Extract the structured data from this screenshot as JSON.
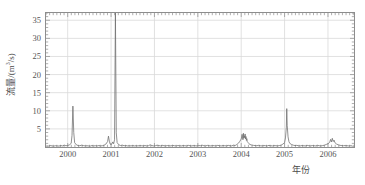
{
  "chart_data": {
    "type": "line",
    "title": "",
    "xlabel": "年份",
    "ylabel_text": "流量/(m",
    "ylabel_sup": "3",
    "ylabel_tail": "/s)",
    "ylabel_full": "流量/(m3/s)",
    "grid": true,
    "legend": "none",
    "xlim": [
      1999.5,
      2006.6
    ],
    "ylim": [
      0,
      37
    ],
    "yticks": [
      5,
      10,
      15,
      20,
      25,
      30,
      35
    ],
    "ytick_labels": [
      "5",
      "10",
      "15",
      "20",
      "25",
      "30",
      "35"
    ],
    "xticks": [
      2000,
      2001,
      2002,
      2003,
      2004,
      2005,
      2006
    ],
    "xtick_labels": [
      "2000",
      "2001",
      "2002",
      "2003",
      "2004",
      "2005",
      "2006"
    ],
    "line_color": "#6b6b6b",
    "grid_color": "#d9d9d9",
    "axis_color": "#8d8d8d",
    "text_color": "#555555",
    "annotations": [
      {
        "x": 2000.12,
        "y": 11.3,
        "label": "2000 peak"
      },
      {
        "x": 2001.1,
        "y": 37.0,
        "label": "2001 peak (clipped off-scale)"
      },
      {
        "x": 2005.05,
        "y": 10.6,
        "label": "2005 peak"
      }
    ],
    "x": [
      1999.52,
      1999.56,
      1999.6,
      1999.64,
      1999.68,
      1999.72,
      1999.76,
      1999.8,
      1999.84,
      1999.88,
      1999.92,
      1999.96,
      2000.0,
      2000.04,
      2000.08,
      2000.1,
      2000.12,
      2000.14,
      2000.16,
      2000.2,
      2000.24,
      2000.28,
      2000.32,
      2000.36,
      2000.4,
      2000.44,
      2000.48,
      2000.52,
      2000.56,
      2000.6,
      2000.64,
      2000.68,
      2000.72,
      2000.76,
      2000.8,
      2000.84,
      2000.88,
      2000.92,
      2000.94,
      2000.96,
      2000.98,
      2001.0,
      2001.02,
      2001.04,
      2001.06,
      2001.08,
      2001.1,
      2001.12,
      2001.14,
      2001.18,
      2001.22,
      2001.26,
      2001.3,
      2001.34,
      2001.38,
      2001.42,
      2001.46,
      2001.5,
      2001.54,
      2001.58,
      2001.62,
      2001.66,
      2001.7,
      2001.74,
      2001.78,
      2001.82,
      2001.86,
      2001.9,
      2001.94,
      2001.98,
      2002.02,
      2002.06,
      2002.1,
      2002.14,
      2002.18,
      2002.22,
      2002.26,
      2002.3,
      2002.34,
      2002.38,
      2002.42,
      2002.46,
      2002.5,
      2002.54,
      2002.58,
      2002.62,
      2002.66,
      2002.7,
      2002.74,
      2002.78,
      2002.82,
      2002.86,
      2002.9,
      2002.94,
      2002.98,
      2003.02,
      2003.06,
      2003.1,
      2003.14,
      2003.18,
      2003.22,
      2003.26,
      2003.3,
      2003.34,
      2003.38,
      2003.42,
      2003.46,
      2003.5,
      2003.54,
      2003.58,
      2003.62,
      2003.66,
      2003.7,
      2003.74,
      2003.78,
      2003.82,
      2003.86,
      2003.9,
      2003.94,
      2003.97,
      2004.0,
      2004.02,
      2004.04,
      2004.05,
      2004.06,
      2004.07,
      2004.08,
      2004.09,
      2004.1,
      2004.11,
      2004.12,
      2004.13,
      2004.14,
      2004.16,
      2004.18,
      2004.2,
      2004.24,
      2004.28,
      2004.32,
      2004.36,
      2004.4,
      2004.44,
      2004.48,
      2004.52,
      2004.56,
      2004.6,
      2004.64,
      2004.68,
      2004.72,
      2004.76,
      2004.8,
      2004.84,
      2004.88,
      2004.92,
      2004.96,
      2005.0,
      2005.02,
      2005.04,
      2005.05,
      2005.06,
      2005.08,
      2005.1,
      2005.12,
      2005.16,
      2005.2,
      2005.24,
      2005.28,
      2005.32,
      2005.36,
      2005.4,
      2005.44,
      2005.48,
      2005.52,
      2005.56,
      2005.6,
      2005.64,
      2005.68,
      2005.72,
      2005.76,
      2005.8,
      2005.84,
      2005.88,
      2005.92,
      2005.96,
      2006.0,
      2006.04,
      2006.06,
      2006.08,
      2006.1,
      2006.12,
      2006.14,
      2006.16,
      2006.2,
      2006.24,
      2006.28,
      2006.32,
      2006.36,
      2006.4,
      2006.44,
      2006.48,
      2006.52,
      2006.56
    ],
    "y": [
      0.3,
      0.25,
      0.4,
      0.3,
      0.25,
      0.35,
      0.3,
      0.25,
      0.4,
      0.3,
      0.5,
      0.35,
      0.4,
      0.6,
      1.0,
      3.2,
      11.3,
      4.0,
      1.2,
      0.6,
      0.4,
      0.35,
      0.5,
      0.4,
      0.3,
      0.35,
      0.3,
      0.25,
      0.4,
      0.3,
      0.35,
      0.3,
      0.4,
      0.3,
      0.35,
      0.5,
      0.8,
      1.5,
      3.0,
      1.6,
      0.8,
      0.6,
      0.9,
      1.4,
      0.9,
      2.0,
      37.0,
      3.9,
      1.2,
      0.6,
      0.4,
      0.5,
      0.35,
      0.4,
      0.3,
      0.35,
      0.3,
      0.4,
      0.3,
      0.35,
      0.3,
      0.4,
      0.35,
      0.3,
      0.4,
      0.3,
      0.35,
      0.6,
      0.4,
      0.3,
      0.35,
      0.5,
      0.4,
      0.3,
      0.45,
      0.35,
      0.3,
      0.4,
      0.35,
      0.3,
      0.45,
      0.35,
      0.3,
      0.4,
      0.35,
      0.3,
      0.4,
      0.35,
      0.3,
      0.45,
      0.35,
      0.3,
      0.4,
      0.35,
      0.3,
      0.4,
      0.35,
      0.5,
      0.35,
      0.3,
      0.45,
      0.35,
      0.3,
      0.4,
      0.35,
      0.3,
      0.45,
      0.35,
      0.3,
      0.4,
      0.35,
      0.3,
      0.45,
      0.35,
      0.3,
      0.5,
      0.4,
      0.7,
      1.1,
      1.6,
      2.2,
      3.5,
      2.0,
      3.8,
      2.4,
      3.1,
      2.6,
      3.6,
      2.2,
      2.9,
      1.8,
      2.3,
      1.5,
      1.2,
      0.9,
      0.7,
      0.55,
      0.45,
      0.4,
      0.35,
      0.45,
      0.35,
      0.3,
      0.4,
      0.35,
      0.3,
      0.45,
      0.35,
      0.3,
      0.4,
      0.35,
      0.3,
      0.4,
      0.5,
      0.8,
      1.2,
      2.5,
      5.5,
      10.6,
      6.0,
      2.8,
      1.5,
      1.0,
      0.7,
      0.5,
      0.4,
      0.45,
      0.35,
      0.3,
      0.4,
      0.35,
      0.3,
      0.45,
      0.35,
      0.3,
      0.4,
      0.35,
      0.3,
      0.45,
      0.35,
      0.3,
      0.4,
      0.5,
      0.7,
      0.9,
      1.3,
      2.1,
      1.4,
      2.4,
      1.5,
      1.9,
      1.2,
      0.8,
      0.6,
      0.45,
      0.4,
      0.35,
      0.4,
      0.35,
      0.3,
      0.35,
      0.3
    ]
  }
}
